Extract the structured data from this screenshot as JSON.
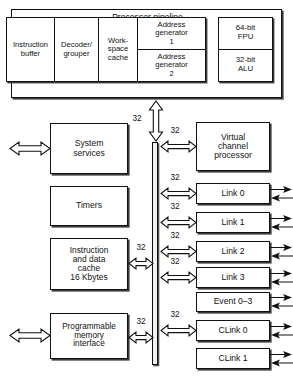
{
  "diagram": {
    "title": "Processor pipeline",
    "bus_width_label": "32",
    "colors": {
      "stroke": "#111111",
      "fill": "#ffffff",
      "shadow": "#3a3a3a",
      "bus_fill": "#f2f2f2"
    }
  },
  "pipeline": {
    "title": "Processor pipeline",
    "stages": [
      {
        "name": "instruction-buffer",
        "label": "Instruction\nbuffer",
        "width": 48
      },
      {
        "name": "decoder-grouper",
        "label": "Decoder/\ngrouper",
        "width": 44
      },
      {
        "name": "workspace-cache",
        "label": "Work-\nspace\ncache",
        "width": 39
      },
      {
        "name": "address-generator-1",
        "label": "Address\ngenerator\n1",
        "width": 69
      },
      {
        "name": "address-generator-2",
        "label": "Address\ngenerator\n2",
        "width": 69
      }
    ],
    "execution_units": [
      {
        "name": "fpu",
        "label": "64-bit\nFPU"
      },
      {
        "name": "alu",
        "label": "32-bit\nALU"
      }
    ]
  },
  "left_blocks": [
    {
      "name": "system-services",
      "label": "System\nservices",
      "external_io": true,
      "bus_width": null
    },
    {
      "name": "timers",
      "label": "Timers",
      "external_io": false,
      "bus_width": null
    },
    {
      "name": "instruction-and-data-cache",
      "label": "Instruction\nand data\ncache\n16 Kbytes",
      "external_io": false,
      "bus_width": "32"
    },
    {
      "name": "programmable-memory-interface",
      "label": "Programmable\nmemory\ninterface",
      "external_io": true,
      "bus_width": "32"
    }
  ],
  "right_blocks": [
    {
      "name": "virtual-channel-processor",
      "label": "Virtual\nchannel\nprocessor",
      "bus_width": "32",
      "external_io": false
    },
    {
      "name": "link-0",
      "label": "Link 0",
      "bus_width": "32",
      "external_io": true
    },
    {
      "name": "link-1",
      "label": "Link 1",
      "bus_width": "32",
      "external_io": true
    },
    {
      "name": "link-2",
      "label": "Link 2",
      "bus_width": "32",
      "external_io": true
    },
    {
      "name": "link-3",
      "label": "Link 3",
      "bus_width": "32",
      "external_io": true
    },
    {
      "name": "event-0-3",
      "label": "Event 0–3",
      "bus_width": null,
      "external_io": true
    },
    {
      "name": "clink-0",
      "label": "CLink 0",
      "bus_width": "32",
      "external_io": true
    },
    {
      "name": "clink-1",
      "label": "CLink 1",
      "bus_width": null,
      "external_io": true
    }
  ],
  "bus_labels": {
    "pipeline_to_bus": "32"
  }
}
